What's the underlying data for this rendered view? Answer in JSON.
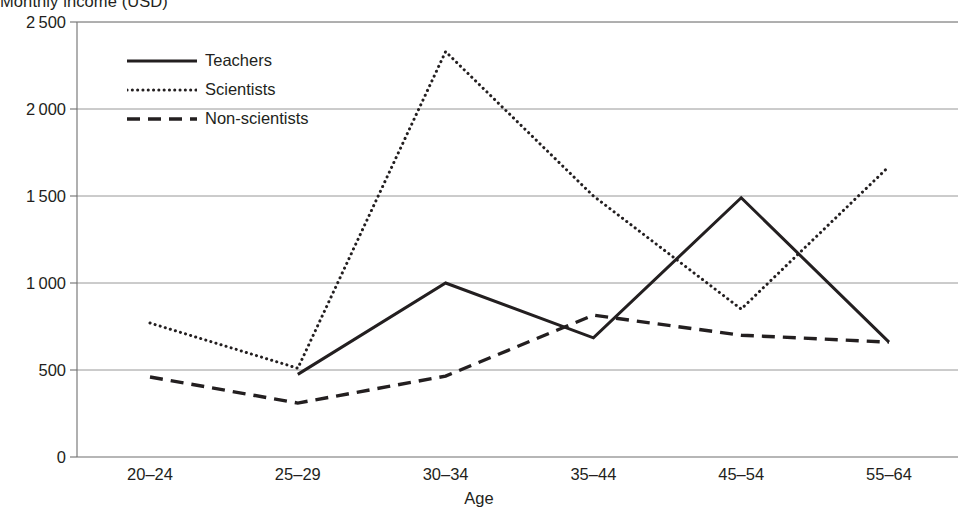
{
  "chart_data": {
    "type": "line",
    "title": "Monthly income (USD)",
    "title_clipped": true,
    "xlabel": "Age",
    "ylabel": "",
    "categories": [
      "20–24",
      "25–29",
      "30–34",
      "35–44",
      "45–54",
      "55–64"
    ],
    "ylim": [
      0,
      2500
    ],
    "yticks": [
      0,
      500,
      1000,
      1500,
      2000,
      2500
    ],
    "ytick_labels": [
      "0",
      "500",
      "1 000",
      "1 500",
      "2 000",
      "2 500"
    ],
    "grid": "horizontal",
    "legend_position": "upper-left-inside",
    "series": [
      {
        "name": "Teachers",
        "style": "solid",
        "color": "#231f20",
        "values": [
          null,
          475,
          1000,
          685,
          1490,
          660
        ]
      },
      {
        "name": "Scientists",
        "style": "dotted",
        "color": "#231f20",
        "values": [
          770,
          510,
          2330,
          1500,
          850,
          1670
        ]
      },
      {
        "name": "Non-scientists",
        "style": "dashed",
        "color": "#231f20",
        "values": [
          460,
          310,
          465,
          815,
          700,
          660
        ]
      }
    ]
  },
  "axis": {
    "x_title": "Age"
  },
  "colors": {
    "ink": "#231f20",
    "grid": "#8d8d8d",
    "axis": "#6f6f6f",
    "background": "#ffffff"
  }
}
